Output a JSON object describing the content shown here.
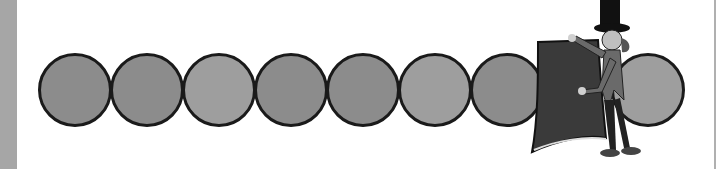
{
  "scene": {
    "description": "Row of nine gray circles; a cartoon magician in a top hat holds a dark cloth covering the eighth circle",
    "circle_count": 9,
    "hidden_circle_index": 8,
    "circles": [
      {
        "index": 1,
        "fill": "#8c8c8c",
        "x": 38
      },
      {
        "index": 2,
        "fill": "#8c8c8c",
        "x": 110
      },
      {
        "index": 3,
        "fill": "#9e9e9e",
        "x": 182
      },
      {
        "index": 4,
        "fill": "#8c8c8c",
        "x": 254
      },
      {
        "index": 5,
        "fill": "#8c8c8c",
        "x": 326
      },
      {
        "index": 6,
        "fill": "#9e9e9e",
        "x": 398
      },
      {
        "index": 7,
        "fill": "#8c8c8c",
        "x": 470
      },
      {
        "index": 9,
        "fill": "#9e9e9e",
        "x": 611
      }
    ],
    "colors": {
      "left_bar": "#a6a6a6",
      "circle_border": "#1a1a1a",
      "cloth": "#3a3a3a"
    }
  }
}
